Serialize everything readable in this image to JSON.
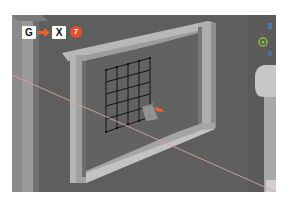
{
  "viewport": {
    "background": "#5f5f5f",
    "x_axis_color": "#d9a3a3",
    "gizmo_arrow_color": "#f0602a",
    "mesh_color": "#111111"
  },
  "shortcut": {
    "keys": [
      "G",
      "X"
    ],
    "arrow_icon": "right-arrow-icon",
    "arrow_color": "#f0602a",
    "step_number": "7",
    "step_color": "#e8502a"
  },
  "nav_gizmo": {
    "y_color": "#8fbf3a",
    "z_color": "#4a7fd0"
  }
}
